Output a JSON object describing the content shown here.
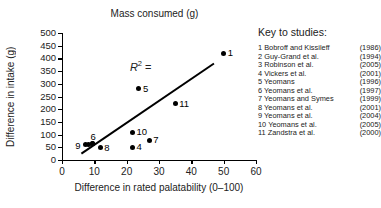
{
  "chart_data": {
    "type": "scatter",
    "title": "Mass consumed (g)",
    "xlabel": "Difference in rated palatability (0–100)",
    "ylabel": "Difference in intake (g)",
    "xlim": [
      0,
      60
    ],
    "ylim": [
      0,
      500
    ],
    "xticks": [
      0,
      10,
      20,
      30,
      40,
      50,
      60
    ],
    "yticks": [
      0,
      50,
      100,
      150,
      200,
      250,
      300,
      350,
      400,
      450,
      500
    ],
    "grid": false,
    "legend_position": "right",
    "annotation": "R² =",
    "annotation_x": 21,
    "annotation_y": 398,
    "points": [
      {
        "label": "1",
        "x": 50.0,
        "y": 420,
        "label_side": "right"
      },
      {
        "label": "2",
        "x": 8.2,
        "y": 62,
        "label_side": "none"
      },
      {
        "label": "3",
        "x": 9.4,
        "y": 64,
        "label_side": "none"
      },
      {
        "label": "4",
        "x": 21.8,
        "y": 50,
        "label_side": "right"
      },
      {
        "label": "5",
        "x": 23.8,
        "y": 280,
        "label_side": "right"
      },
      {
        "label": "6",
        "x": 9.4,
        "y": 64,
        "label_side": "above"
      },
      {
        "label": "7",
        "x": 27.0,
        "y": 78,
        "label_side": "right"
      },
      {
        "label": "8",
        "x": 11.8,
        "y": 48,
        "label_side": "right"
      },
      {
        "label": "9",
        "x": 7.2,
        "y": 62,
        "label_side": "left"
      },
      {
        "label": "10",
        "x": 21.8,
        "y": 110,
        "label_side": "right"
      },
      {
        "label": "11",
        "x": 35.0,
        "y": 222,
        "label_side": "right"
      }
    ],
    "fit_line": {
      "x1": 6.0,
      "y1": 25,
      "x2": 47.0,
      "y2": 380
    }
  },
  "legend": {
    "title": "Key to studies:",
    "entries": [
      {
        "num": "1",
        "name": "1 Bobroff and Kissileff",
        "year": "(1986)"
      },
      {
        "num": "2",
        "name": "2 Guy-Grand et al.",
        "year": "(1994)"
      },
      {
        "num": "3",
        "name": "3 Robinson et al.",
        "year": "(2005)"
      },
      {
        "num": "4",
        "name": "4 Vickers et al.",
        "year": "(2001)"
      },
      {
        "num": "5",
        "name": "5 Yeomans",
        "year": "(1996)"
      },
      {
        "num": "6",
        "name": "6 Yeomans et al.",
        "year": "(1997)"
      },
      {
        "num": "7",
        "name": "7 Yeomans and Symes",
        "year": "(1999)"
      },
      {
        "num": "8",
        "name": "8 Yeomans et al.",
        "year": "(2001)"
      },
      {
        "num": "9",
        "name": "9 Yeomans et al.",
        "year": "(2004)"
      },
      {
        "num": "10",
        "name": "10 Yeomans et al.",
        "year": "(2005)"
      },
      {
        "num": "11",
        "name": "11 Zandstra et al.",
        "year": "(2000)"
      }
    ]
  },
  "colors": {
    "axis": "#000000",
    "marker": "#000000",
    "text": "#222222",
    "background": "#ffffff"
  }
}
